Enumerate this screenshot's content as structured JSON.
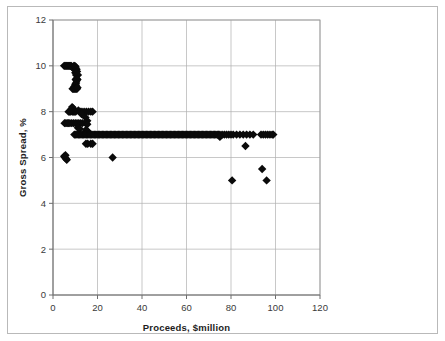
{
  "figure": {
    "name": "gross-spread-vs-proceeds-scatter",
    "background_color": "#ffffff",
    "frame_color": "#b9b9b9",
    "marker_color": "#0a0a0a",
    "grid_color": "#b0b0b0",
    "axis_color": "#6e6e6e"
  },
  "chart_data": {
    "type": "scatter",
    "title": "",
    "xlabel": "Proceeds, $million",
    "ylabel": "Gross Spread, %",
    "xlim": [
      0,
      120
    ],
    "ylim": [
      0,
      12
    ],
    "xticks": [
      0,
      20,
      40,
      60,
      80,
      100,
      120
    ],
    "yticks": [
      0,
      2,
      4,
      6,
      8,
      10,
      12
    ],
    "xtick_labels": [
      "0",
      "20",
      "40",
      "60",
      "80",
      "100",
      "120"
    ],
    "ytick_labels": [
      "0",
      "2",
      "4",
      "6",
      "8",
      "10",
      "12"
    ],
    "grid": true,
    "grid_axes": "both",
    "legend": false,
    "legend_position": "none",
    "marker": "diamond",
    "marker_size": 4.2,
    "series": [
      {
        "name": "IPO gross spread",
        "points": [
          [
            5.0,
            10.0
          ],
          [
            5.4,
            10.0
          ],
          [
            5.8,
            10.0
          ],
          [
            6.2,
            10.0
          ],
          [
            6.6,
            10.0
          ],
          [
            7.0,
            10.0
          ],
          [
            7.4,
            10.0
          ],
          [
            7.8,
            10.0
          ],
          [
            8.2,
            10.0
          ],
          [
            8.6,
            9.95
          ],
          [
            9.0,
            9.9
          ],
          [
            9.4,
            10.0
          ],
          [
            9.8,
            10.0
          ],
          [
            10.2,
            9.95
          ],
          [
            10.6,
            9.85
          ],
          [
            10.0,
            9.7
          ],
          [
            10.4,
            9.6
          ],
          [
            10.8,
            9.75
          ],
          [
            11.2,
            9.6
          ],
          [
            10.6,
            9.45
          ],
          [
            10.2,
            9.4
          ],
          [
            10.6,
            9.35
          ],
          [
            11.0,
            9.4
          ],
          [
            10.4,
            9.25
          ],
          [
            10.0,
            9.2
          ],
          [
            10.3,
            9.15
          ],
          [
            9.6,
            9.1
          ],
          [
            9.2,
            9.0
          ],
          [
            9.6,
            9.0
          ],
          [
            10.0,
            9.0
          ],
          [
            10.4,
            9.0
          ],
          [
            10.8,
            9.0
          ],
          [
            8.8,
            9.0
          ],
          [
            11.0,
            9.05
          ],
          [
            8.6,
            8.2
          ],
          [
            9.0,
            8.15
          ],
          [
            8.2,
            8.1
          ],
          [
            8.6,
            8.0
          ],
          [
            9.0,
            8.0
          ],
          [
            9.4,
            8.0
          ],
          [
            9.8,
            8.0
          ],
          [
            10.2,
            8.0
          ],
          [
            7.8,
            8.0
          ],
          [
            7.4,
            8.0
          ],
          [
            7.0,
            8.0
          ],
          [
            11.4,
            8.05
          ],
          [
            12.2,
            8.0
          ],
          [
            13.0,
            8.0
          ],
          [
            14.0,
            8.0
          ],
          [
            15.0,
            8.0
          ],
          [
            16.0,
            8.0
          ],
          [
            17.0,
            8.0
          ],
          [
            17.8,
            8.0
          ],
          [
            12.8,
            7.9
          ],
          [
            14.6,
            7.75
          ],
          [
            15.4,
            7.6
          ],
          [
            5.2,
            7.5
          ],
          [
            5.8,
            7.5
          ],
          [
            6.4,
            7.5
          ],
          [
            7.0,
            7.5
          ],
          [
            7.6,
            7.5
          ],
          [
            8.4,
            7.5
          ],
          [
            9.2,
            7.5
          ],
          [
            10.0,
            7.5
          ],
          [
            10.8,
            7.5
          ],
          [
            11.6,
            7.5
          ],
          [
            12.4,
            7.5
          ],
          [
            13.2,
            7.5
          ],
          [
            14.6,
            7.5
          ],
          [
            15.4,
            7.45
          ],
          [
            11.2,
            7.3
          ],
          [
            12.0,
            7.25
          ],
          [
            14.8,
            7.2
          ],
          [
            15.6,
            7.15
          ],
          [
            9.6,
            7.0
          ],
          [
            10.2,
            7.0
          ],
          [
            10.8,
            7.0
          ],
          [
            11.4,
            7.0
          ],
          [
            12.0,
            7.0
          ],
          [
            12.6,
            7.0
          ],
          [
            13.2,
            7.0
          ],
          [
            13.8,
            7.0
          ],
          [
            14.4,
            7.0
          ],
          [
            15.0,
            7.0
          ],
          [
            15.6,
            7.0
          ],
          [
            16.2,
            7.0
          ],
          [
            16.8,
            7.0
          ],
          [
            17.4,
            7.0
          ],
          [
            18.0,
            7.0
          ],
          [
            18.6,
            7.0
          ],
          [
            19.2,
            7.0
          ],
          [
            19.8,
            7.0
          ],
          [
            20.4,
            7.0
          ],
          [
            21.0,
            7.0
          ],
          [
            21.6,
            7.0
          ],
          [
            22.2,
            7.0
          ],
          [
            22.8,
            7.0
          ],
          [
            23.4,
            7.0
          ],
          [
            24.0,
            7.0
          ],
          [
            24.6,
            7.0
          ],
          [
            25.2,
            7.0
          ],
          [
            25.8,
            7.0
          ],
          [
            26.4,
            7.0
          ],
          [
            27.0,
            7.0
          ],
          [
            27.6,
            7.0
          ],
          [
            28.2,
            7.0
          ],
          [
            28.8,
            7.0
          ],
          [
            29.4,
            7.0
          ],
          [
            30.0,
            7.0
          ],
          [
            30.6,
            7.0
          ],
          [
            31.2,
            7.0
          ],
          [
            31.8,
            7.0
          ],
          [
            32.4,
            7.0
          ],
          [
            33.0,
            7.0
          ],
          [
            33.6,
            7.0
          ],
          [
            34.2,
            7.0
          ],
          [
            34.8,
            7.0
          ],
          [
            35.4,
            7.0
          ],
          [
            36.0,
            7.0
          ],
          [
            36.6,
            7.0
          ],
          [
            37.2,
            7.0
          ],
          [
            37.8,
            7.0
          ],
          [
            38.4,
            7.0
          ],
          [
            39.0,
            7.0
          ],
          [
            39.6,
            7.0
          ],
          [
            40.2,
            7.0
          ],
          [
            40.8,
            7.0
          ],
          [
            41.4,
            7.0
          ],
          [
            42.0,
            7.0
          ],
          [
            42.6,
            7.0
          ],
          [
            43.2,
            7.0
          ],
          [
            43.8,
            7.0
          ],
          [
            44.4,
            7.0
          ],
          [
            45.0,
            7.0
          ],
          [
            45.6,
            7.0
          ],
          [
            46.2,
            7.0
          ],
          [
            46.8,
            7.0
          ],
          [
            47.4,
            7.0
          ],
          [
            48.0,
            7.0
          ],
          [
            48.6,
            7.0
          ],
          [
            49.2,
            7.0
          ],
          [
            49.8,
            7.0
          ],
          [
            50.4,
            7.0
          ],
          [
            51.0,
            7.0
          ],
          [
            51.6,
            7.0
          ],
          [
            52.2,
            7.0
          ],
          [
            52.8,
            7.0
          ],
          [
            53.4,
            7.0
          ],
          [
            54.0,
            7.0
          ],
          [
            54.6,
            7.0
          ],
          [
            55.2,
            7.0
          ],
          [
            55.8,
            7.0
          ],
          [
            56.4,
            7.0
          ],
          [
            57.0,
            7.0
          ],
          [
            57.6,
            7.0
          ],
          [
            58.2,
            7.0
          ],
          [
            58.8,
            7.0
          ],
          [
            59.4,
            7.0
          ],
          [
            60.0,
            7.0
          ],
          [
            60.6,
            7.0
          ],
          [
            61.2,
            7.0
          ],
          [
            61.8,
            7.0
          ],
          [
            62.4,
            7.0
          ],
          [
            63.0,
            7.0
          ],
          [
            63.6,
            7.0
          ],
          [
            64.2,
            7.0
          ],
          [
            64.8,
            7.0
          ],
          [
            65.4,
            7.0
          ],
          [
            66.0,
            7.0
          ],
          [
            66.6,
            7.0
          ],
          [
            67.2,
            7.0
          ],
          [
            67.8,
            7.0
          ],
          [
            68.4,
            7.0
          ],
          [
            69.0,
            7.0
          ],
          [
            69.6,
            7.0
          ],
          [
            70.2,
            7.0
          ],
          [
            70.8,
            7.0
          ],
          [
            71.4,
            7.0
          ],
          [
            72.0,
            7.0
          ],
          [
            72.6,
            7.0
          ],
          [
            73.2,
            7.0
          ],
          [
            73.8,
            7.0
          ],
          [
            74.4,
            7.0
          ],
          [
            75.0,
            7.0
          ],
          [
            76.0,
            7.0
          ],
          [
            77.0,
            7.0
          ],
          [
            78.0,
            7.0
          ],
          [
            79.0,
            7.0
          ],
          [
            80.0,
            7.0
          ],
          [
            81.0,
            7.0
          ],
          [
            82.5,
            7.0
          ],
          [
            84.0,
            7.0
          ],
          [
            85.5,
            7.0
          ],
          [
            87.0,
            7.0
          ],
          [
            88.5,
            7.0
          ],
          [
            90.0,
            7.0
          ],
          [
            93.5,
            7.0
          ],
          [
            94.5,
            7.0
          ],
          [
            95.5,
            7.0
          ],
          [
            96.5,
            7.0
          ],
          [
            97.5,
            7.0
          ],
          [
            98.5,
            7.0
          ],
          [
            99.0,
            7.0
          ],
          [
            75.0,
            6.9
          ],
          [
            14.8,
            6.6
          ],
          [
            15.6,
            6.6
          ],
          [
            17.0,
            6.6
          ],
          [
            17.8,
            6.6
          ],
          [
            86.5,
            6.5
          ],
          [
            5.0,
            6.05
          ],
          [
            5.4,
            6.0
          ],
          [
            5.8,
            5.95
          ],
          [
            6.2,
            5.9
          ],
          [
            5.6,
            6.1
          ],
          [
            26.8,
            6.0
          ],
          [
            80.5,
            5.0
          ],
          [
            96.0,
            5.0
          ],
          [
            94.0,
            5.5
          ]
        ]
      }
    ]
  },
  "axes": {
    "x_axis_name": "x-axis",
    "y_axis_name": "y-axis"
  }
}
